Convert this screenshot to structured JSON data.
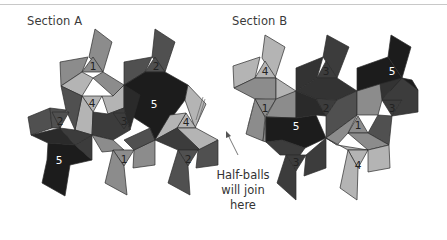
{
  "diagram": {
    "sections": [
      {
        "title": "Section A",
        "labels": [
          {
            "text": "1",
            "x": 93,
            "y": 66,
            "color": "#222222"
          },
          {
            "text": "2",
            "x": 156,
            "y": 66,
            "color": "#222222"
          },
          {
            "text": "4",
            "x": 92,
            "y": 103,
            "color": "#222222"
          },
          {
            "text": "5",
            "x": 154,
            "y": 104,
            "color": "#ffffff"
          },
          {
            "text": "2",
            "x": 60,
            "y": 121,
            "color": "#222222"
          },
          {
            "text": "3",
            "x": 124,
            "y": 121,
            "color": "#222222"
          },
          {
            "text": "4",
            "x": 186,
            "y": 122,
            "color": "#222222"
          },
          {
            "text": "5",
            "x": 59,
            "y": 160,
            "color": "#ffffff"
          },
          {
            "text": "1",
            "x": 124,
            "y": 159,
            "color": "#222222"
          },
          {
            "text": "2",
            "x": 188,
            "y": 159,
            "color": "#222222"
          }
        ]
      },
      {
        "title": "Section B",
        "labels": [
          {
            "text": "4",
            "x": 265,
            "y": 71,
            "color": "#222222"
          },
          {
            "text": "3",
            "x": 326,
            "y": 71,
            "color": "#222222"
          },
          {
            "text": "5",
            "x": 392,
            "y": 71,
            "color": "#ffffff"
          },
          {
            "text": "1",
            "x": 265,
            "y": 108,
            "color": "#222222"
          },
          {
            "text": "2",
            "x": 326,
            "y": 108,
            "color": "#222222"
          },
          {
            "text": "3",
            "x": 392,
            "y": 108,
            "color": "#222222"
          },
          {
            "text": "5",
            "x": 296,
            "y": 126,
            "color": "#ffffff"
          },
          {
            "text": "1",
            "x": 358,
            "y": 125,
            "color": "#222222"
          },
          {
            "text": "3",
            "x": 296,
            "y": 162,
            "color": "#222222"
          },
          {
            "text": "4",
            "x": 358,
            "y": 165,
            "color": "#222222"
          }
        ]
      }
    ],
    "callout": {
      "line1": "Half-balls",
      "line2": "will join here"
    },
    "colors": {
      "shade_1": "#8c8c8c",
      "shade_2": "#505050",
      "shade_3": "#3c3c3c",
      "shade_4": "#b4b4b4",
      "shade_5": "#1c1c1c",
      "background": "#ffffff"
    }
  }
}
